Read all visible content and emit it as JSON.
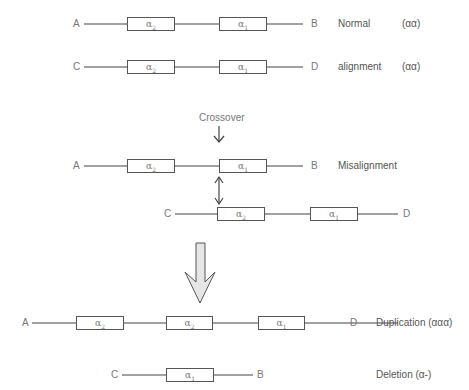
{
  "diagram": {
    "type": "alpha-globin unequal crossover",
    "rows": [
      {
        "id": "normal_ab",
        "left_end": "A",
        "right_end": "B",
        "genes": [
          {
            "name": "α",
            "sub": "2"
          },
          {
            "name": "α",
            "sub": "1"
          }
        ],
        "label": "Normal",
        "genotype": "(αα)"
      },
      {
        "id": "normal_cd",
        "left_end": "C",
        "right_end": "D",
        "genes": [
          {
            "name": "α",
            "sub": "2"
          },
          {
            "name": "α",
            "sub": "1"
          }
        ],
        "label": "alignment",
        "genotype": "(αα)"
      },
      {
        "id": "mis_ab",
        "left_end": "A",
        "right_end": "B",
        "genes": [
          {
            "name": "α",
            "sub": "2"
          },
          {
            "name": "α",
            "sub": "1"
          }
        ],
        "label": "Misalignment"
      },
      {
        "id": "mis_cd",
        "left_end": "C",
        "right_end": "D",
        "genes": [
          {
            "name": "α",
            "sub": "2"
          },
          {
            "name": "α",
            "sub": "1"
          }
        ]
      },
      {
        "id": "dup",
        "left_end": "A",
        "right_end": "D",
        "genes": [
          {
            "name": "α",
            "sub": "2"
          },
          {
            "name": "α",
            "sub": "2"
          },
          {
            "name": "α",
            "sub": "1"
          }
        ],
        "label": "Duplication (ααα)"
      },
      {
        "id": "del",
        "left_end": "C",
        "right_end": "B",
        "genes": [
          {
            "name": "α",
            "sub": "1"
          }
        ],
        "label": "Deletion (α-)"
      }
    ],
    "crossover_label": "Crossover"
  }
}
